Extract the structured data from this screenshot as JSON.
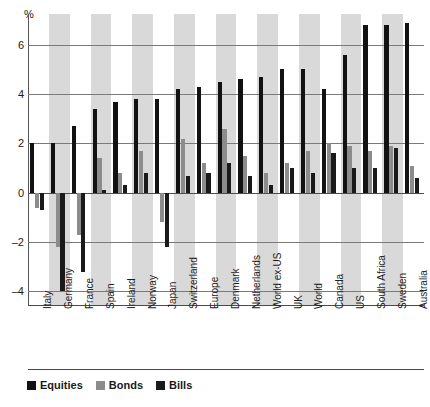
{
  "chart_data": {
    "type": "bar",
    "title": "",
    "xlabel": "",
    "ylabel": "%",
    "ylim": [
      -4.5,
      7.3
    ],
    "yticks": [
      6,
      4,
      2,
      0,
      -2,
      -4
    ],
    "ytick_labels": [
      "6",
      "4",
      "2",
      "0",
      "-2",
      "-4"
    ],
    "grid": true,
    "legend_position": "bottom-left",
    "categories": [
      "Italy",
      "Germany",
      "France",
      "Spain",
      "Ireland",
      "Norway",
      "Japan",
      "Switzerland",
      "Europe",
      "Denmark",
      "Netherlands",
      "World ex-US",
      "UK",
      "World",
      "Canada",
      "US",
      "South Africa",
      "Sweden",
      "Australia"
    ],
    "series": [
      {
        "name": "Equities",
        "color": "#121212",
        "values": [
          2.0,
          2.0,
          2.7,
          3.4,
          3.7,
          3.8,
          3.8,
          4.2,
          4.3,
          4.5,
          4.6,
          4.7,
          5.0,
          5.0,
          4.2,
          5.6,
          6.8,
          6.8,
          6.9
        ]
      },
      {
        "name": "Bonds",
        "color": "#8c8c8c",
        "values": [
          -0.6,
          -2.2,
          -1.7,
          1.4,
          0.8,
          1.7,
          -1.2,
          2.2,
          1.2,
          2.6,
          1.5,
          0.8,
          1.2,
          1.7,
          2.0,
          1.9,
          1.7,
          1.9,
          1.1
        ]
      },
      {
        "name": "Bills",
        "color": "#1a1a1a",
        "values": [
          -0.7,
          -4.0,
          -3.2,
          0.1,
          0.3,
          0.8,
          -2.2,
          0.7,
          0.8,
          1.2,
          0.7,
          0.3,
          1.0,
          0.8,
          1.6,
          1.0,
          1.0,
          1.8,
          0.6
        ]
      }
    ]
  },
  "legend": {
    "items": [
      {
        "label": "Equities",
        "color": "#121212"
      },
      {
        "label": "Bonds",
        "color": "#8c8c8c"
      },
      {
        "label": "Bills",
        "color": "#1a1a1a"
      }
    ]
  }
}
